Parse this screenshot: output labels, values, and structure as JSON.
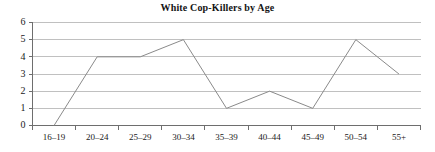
{
  "chart_data": {
    "type": "line",
    "title": "White Cop-Killers by Age",
    "xlabel": "",
    "ylabel": "",
    "categories": [
      "16–19",
      "20–24",
      "25–29",
      "30–34",
      "35–39",
      "40–44",
      "45–49",
      "50–54",
      "55+"
    ],
    "values": [
      0,
      4,
      4,
      5,
      1,
      2,
      1,
      5,
      3
    ],
    "series": [
      {
        "name": "White Cop-Killers",
        "values": [
          0,
          4,
          4,
          5,
          1,
          2,
          1,
          5,
          3
        ]
      }
    ],
    "ylim": [
      0,
      6
    ],
    "ytick_labels": [
      "0",
      "1",
      "2",
      "3",
      "4",
      "5",
      "6"
    ],
    "ytick_values": [
      0,
      1,
      2,
      3,
      4,
      5,
      6
    ],
    "grid": "horizontal",
    "legend": "none",
    "colors": {
      "line": "#8a8a8a",
      "gridline": "#b9b9b9",
      "axis": "#6e6e6e",
      "text": "#1a1a1a",
      "background": "#ffffff"
    }
  }
}
